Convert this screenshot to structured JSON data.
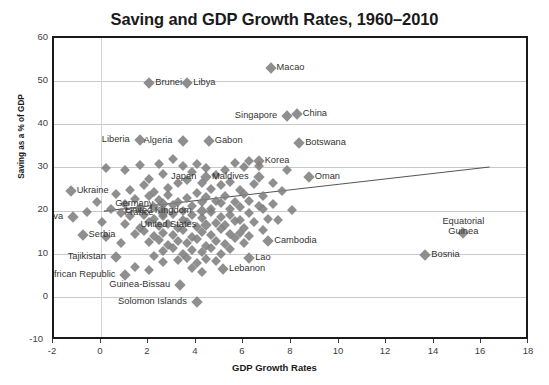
{
  "chart_data": {
    "type": "scatter",
    "title": "Saving and GDP Growth Rates, 1960–2010",
    "xlabel": "GDP Growth Rates",
    "ylabel": "Saving as a % of GDP",
    "xlim": [
      -2,
      18
    ],
    "ylim": [
      -10,
      60
    ],
    "xticks": [
      "-2",
      "0",
      "2",
      "4",
      "6",
      "8",
      "10",
      "12",
      "14",
      "16",
      "18"
    ],
    "yticks": [
      "-10",
      "0",
      "10",
      "20",
      "30",
      "40",
      "50",
      "60"
    ],
    "grid": "horizontal-and-vertical-light",
    "legend": "none",
    "marker": {
      "shape": "diamond",
      "color": "#808080",
      "size": 7
    },
    "trendline": {
      "present": true,
      "color": "#555555",
      "x_start": 0.1,
      "y_start": 20.0,
      "x_end": 16.3,
      "y_end": 30.2
    },
    "labeled_points": [
      {
        "name": "Macao",
        "x": 7.1,
        "y": 53.0
      },
      {
        "name": "Brunei",
        "x": 2.0,
        "y": 49.5
      },
      {
        "name": "Libya",
        "x": 3.6,
        "y": 49.5
      },
      {
        "name": "Singapore",
        "x": 7.8,
        "y": 42.0
      },
      {
        "name": "China",
        "x": 8.2,
        "y": 42.5
      },
      {
        "name": "Liberia",
        "x": 1.6,
        "y": 36.5
      },
      {
        "name": "Algeria",
        "x": 3.4,
        "y": 36.3
      },
      {
        "name": "Gabon",
        "x": 4.5,
        "y": 36.3
      },
      {
        "name": "Botswana",
        "x": 8.3,
        "y": 35.8
      },
      {
        "name": "Korea",
        "x": 6.6,
        "y": 31.5
      },
      {
        "name": "Japan",
        "x": 4.4,
        "y": 28.0
      },
      {
        "name": "Maldives",
        "x": 6.6,
        "y": 27.8
      },
      {
        "name": "Oman",
        "x": 8.7,
        "y": 28.0
      },
      {
        "name": "Ukraine",
        "x": -1.3,
        "y": 24.6
      },
      {
        "name": "Germany",
        "x": 2.6,
        "y": 21.7
      },
      {
        "name": "United Kingdom",
        "x": 4.2,
        "y": 20.0
      },
      {
        "name": "Moldova",
        "x": -1.2,
        "y": 18.6
      },
      {
        "name": "France",
        "x": 2.6,
        "y": 19.6
      },
      {
        "name": "United States",
        "x": 4.4,
        "y": 16.8
      },
      {
        "name": "Serbia",
        "x": -0.8,
        "y": 14.4
      },
      {
        "name": "Cambodia",
        "x": 7.0,
        "y": 13.0
      },
      {
        "name": "Equatorial Guinea",
        "x": 15.2,
        "y": 15.0
      },
      {
        "name": "Bosnia",
        "x": 13.6,
        "y": 9.9
      },
      {
        "name": "Tajikistan",
        "x": 0.6,
        "y": 9.5
      },
      {
        "name": "Lao",
        "x": 6.2,
        "y": 9.2
      },
      {
        "name": "Lebanon",
        "x": 5.1,
        "y": 6.6
      },
      {
        "name": "Central African Republic",
        "x": 1.0,
        "y": 5.2
      },
      {
        "name": "Guinea-Bissau",
        "x": 3.3,
        "y": 3.0
      },
      {
        "name": "Solomon Islands",
        "x": 4.0,
        "y": -1.0
      }
    ],
    "cloud_points": [
      [
        0.2,
        30.0
      ],
      [
        1.0,
        29.6
      ],
      [
        1.6,
        30.6
      ],
      [
        2.4,
        31.0
      ],
      [
        2.0,
        27.5
      ],
      [
        2.6,
        28.6
      ],
      [
        3.0,
        32.0
      ],
      [
        3.4,
        30.4
      ],
      [
        3.8,
        29.0
      ],
      [
        4.0,
        31.0
      ],
      [
        4.4,
        30.0
      ],
      [
        4.8,
        28.4
      ],
      [
        5.2,
        29.4
      ],
      [
        5.6,
        31.2
      ],
      [
        6.0,
        30.2
      ],
      [
        6.2,
        31.6
      ],
      [
        6.6,
        30.4
      ],
      [
        5.0,
        26.0
      ],
      [
        3.2,
        26.4
      ],
      [
        2.8,
        25.4
      ],
      [
        2.2,
        24.4
      ],
      [
        1.8,
        26.0
      ],
      [
        1.2,
        25.0
      ],
      [
        0.6,
        24.0
      ],
      [
        3.6,
        27.2
      ],
      [
        4.2,
        26.6
      ],
      [
        4.6,
        25.2
      ],
      [
        5.4,
        26.8
      ],
      [
        5.8,
        25.0
      ],
      [
        6.4,
        26.2
      ],
      [
        2.0,
        23.4
      ],
      [
        2.4,
        22.6
      ],
      [
        2.8,
        23.8
      ],
      [
        3.2,
        22.2
      ],
      [
        3.6,
        23.0
      ],
      [
        4.0,
        24.2
      ],
      [
        4.4,
        23.2
      ],
      [
        4.8,
        22.4
      ],
      [
        5.2,
        23.6
      ],
      [
        5.6,
        22.0
      ],
      [
        6.0,
        24.0
      ],
      [
        1.4,
        22.8
      ],
      [
        1.0,
        21.6
      ],
      [
        1.6,
        20.8
      ],
      [
        2.2,
        21.0
      ],
      [
        2.6,
        20.2
      ],
      [
        3.0,
        21.4
      ],
      [
        3.4,
        20.0
      ],
      [
        3.8,
        21.2
      ],
      [
        4.2,
        22.0
      ],
      [
        4.6,
        20.6
      ],
      [
        5.0,
        21.8
      ],
      [
        5.4,
        20.4
      ],
      [
        5.8,
        21.0
      ],
      [
        6.2,
        22.4
      ],
      [
        6.6,
        21.2
      ],
      [
        0.8,
        19.6
      ],
      [
        1.2,
        18.8
      ],
      [
        1.8,
        19.2
      ],
      [
        2.2,
        18.2
      ],
      [
        2.6,
        18.8
      ],
      [
        3.0,
        19.4
      ],
      [
        3.4,
        18.0
      ],
      [
        3.8,
        19.0
      ],
      [
        4.2,
        18.4
      ],
      [
        4.6,
        19.8
      ],
      [
        5.0,
        18.6
      ],
      [
        5.4,
        19.2
      ],
      [
        5.8,
        18.0
      ],
      [
        6.2,
        19.6
      ],
      [
        6.8,
        20.4
      ],
      [
        7.2,
        21.6
      ],
      [
        1.0,
        17.0
      ],
      [
        1.6,
        16.2
      ],
      [
        2.0,
        17.4
      ],
      [
        2.4,
        16.6
      ],
      [
        2.8,
        17.0
      ],
      [
        3.2,
        16.0
      ],
      [
        3.6,
        17.6
      ],
      [
        4.0,
        16.4
      ],
      [
        4.8,
        17.2
      ],
      [
        5.2,
        16.8
      ],
      [
        5.6,
        17.8
      ],
      [
        6.0,
        16.2
      ],
      [
        6.4,
        17.4
      ],
      [
        7.0,
        18.2
      ],
      [
        1.4,
        14.8
      ],
      [
        1.8,
        15.4
      ],
      [
        2.2,
        14.2
      ],
      [
        2.6,
        15.0
      ],
      [
        3.0,
        14.6
      ],
      [
        3.4,
        15.6
      ],
      [
        3.8,
        14.0
      ],
      [
        4.2,
        15.2
      ],
      [
        4.6,
        14.4
      ],
      [
        5.0,
        15.8
      ],
      [
        5.4,
        14.8
      ],
      [
        5.8,
        15.0
      ],
      [
        6.2,
        14.2
      ],
      [
        6.8,
        15.6
      ],
      [
        2.0,
        12.8
      ],
      [
        2.4,
        13.4
      ],
      [
        2.8,
        12.2
      ],
      [
        3.2,
        13.0
      ],
      [
        3.6,
        12.6
      ],
      [
        4.0,
        13.6
      ],
      [
        4.4,
        12.0
      ],
      [
        4.8,
        13.2
      ],
      [
        5.2,
        12.4
      ],
      [
        5.6,
        13.8
      ],
      [
        6.0,
        12.6
      ],
      [
        2.6,
        10.8
      ],
      [
        3.0,
        11.4
      ],
      [
        3.4,
        10.2
      ],
      [
        3.8,
        11.0
      ],
      [
        4.2,
        10.6
      ],
      [
        4.6,
        11.6
      ],
      [
        5.0,
        10.0
      ],
      [
        5.4,
        11.2
      ],
      [
        3.2,
        8.6
      ],
      [
        3.6,
        9.2
      ],
      [
        4.0,
        8.0
      ],
      [
        4.4,
        9.0
      ],
      [
        4.8,
        8.4
      ],
      [
        2.6,
        8.2
      ],
      [
        2.2,
        9.6
      ],
      [
        3.8,
        6.8
      ],
      [
        4.2,
        6.0
      ],
      [
        2.0,
        6.4
      ],
      [
        1.4,
        7.2
      ],
      [
        -0.2,
        22.0
      ],
      [
        -0.6,
        19.8
      ],
      [
        0.0,
        17.6
      ],
      [
        0.4,
        20.6
      ],
      [
        0.2,
        14.0
      ],
      [
        0.8,
        12.6
      ],
      [
        7.6,
        24.6
      ],
      [
        7.2,
        26.4
      ],
      [
        8.0,
        20.2
      ],
      [
        7.4,
        18.0
      ],
      [
        6.8,
        23.4
      ],
      [
        7.8,
        29.4
      ]
    ]
  }
}
